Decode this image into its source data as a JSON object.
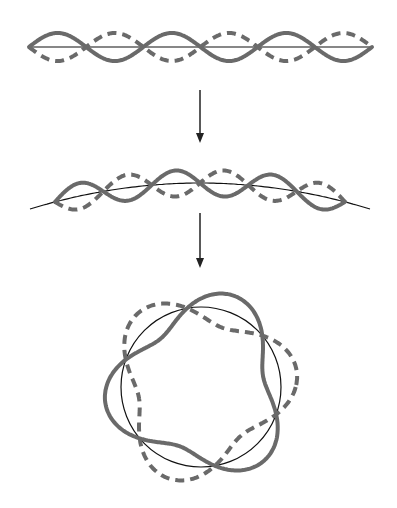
{
  "diagram": {
    "colors": {
      "wave": "#6a6a6a",
      "baseline": "#111111",
      "arrow": "#222222"
    },
    "stages": [
      {
        "name": "straight-string",
        "x0": 29,
        "x1": 372,
        "y": 47,
        "amplitude": 14,
        "half_waves": 6
      },
      {
        "name": "bent-string",
        "arc_x0": 30,
        "arc_x1": 370,
        "arc_y_ends": 209,
        "arc_y_top": 183,
        "wave_x0": 55,
        "wave_x1": 345,
        "amplitude": 13,
        "half_waves": 6
      },
      {
        "name": "circle",
        "cx": 201,
        "cy": 387,
        "r": 80,
        "amplitude": 17,
        "cycles": 3,
        "phase_deg": 100
      }
    ],
    "arrows": [
      {
        "x": 200,
        "y1": 90,
        "y2": 143
      },
      {
        "x": 200,
        "y1": 213,
        "y2": 268
      }
    ]
  }
}
